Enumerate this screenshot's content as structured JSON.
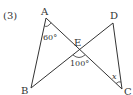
{
  "problem_number": "(3)",
  "points": {
    "A": {
      "label": "A",
      "x": 46,
      "y": 18
    },
    "B": {
      "label": "B",
      "x": 31,
      "y": 88
    },
    "C": {
      "label": "C",
      "x": 122,
      "y": 89
    },
    "D": {
      "label": "D",
      "x": 113,
      "y": 23
    },
    "E": {
      "label": "E",
      "x": 79,
      "y": 50
    }
  },
  "angles": {
    "A": "60°",
    "E": "100°",
    "C": "x"
  },
  "colors": {
    "line": "#333333"
  }
}
